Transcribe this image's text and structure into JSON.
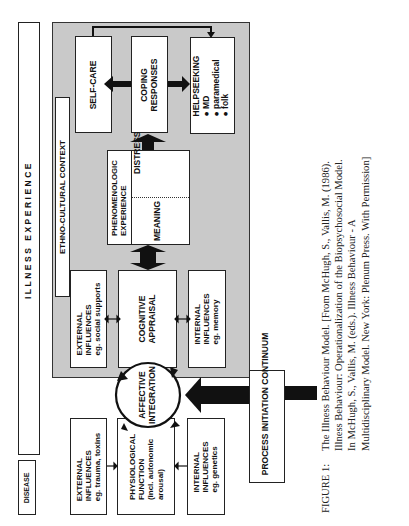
{
  "diagram": {
    "title_strip": "ILLNESS EXPERIENCE",
    "disease_label": "DISEASE",
    "context_label": "ETHNO-CULTURAL CONTEXT",
    "outcomes": {
      "self_care": "SELF-CARE",
      "coping": [
        "COPING",
        "RESPONSES"
      ],
      "helpseeking": {
        "title": "HELPSEEKING",
        "items": [
          "MD",
          "paramedical",
          "folk"
        ],
        "bullet": "●"
      }
    },
    "phenomenologic": {
      "title": [
        "PHENOMENOLOGIC",
        "EXPERIENCE"
      ],
      "meaning": "MEANING",
      "distress": "DISTRESS"
    },
    "appraisal_row": {
      "external": [
        "EXTERNAL",
        "INFLUENCES",
        "eg. social supports"
      ],
      "cognitive": [
        "COGNITIVE",
        "APPRAISAL"
      ],
      "internal": [
        "INTERNAL",
        "INFLUENCES",
        "eg. memory"
      ]
    },
    "affective": [
      "AFFECTIVE",
      "INTEGRATION"
    ],
    "physiological_row": {
      "external": [
        "EXTERNAL",
        "INFLUENCES",
        "eg. trauma, toxins"
      ],
      "physiological": [
        "PHYSIOLOGICAL",
        "FUNCTION",
        "(incl. autonomic",
        "arousal)"
      ],
      "internal": [
        "INTERNAL",
        "INFLUENCES",
        "eg. genetics"
      ]
    },
    "process_label": "PROCESS INITIATION CONTINUUM",
    "colors": {
      "shade": "#c9c9c9",
      "ink": "#111111",
      "paper": "#ffffff"
    }
  },
  "caption": {
    "label": "FIGURE 1:",
    "lines": [
      "The Illness Behaviour Model.  [From McHugh, S., Vallis, M. (1986).",
      "Illness Behaviour:  Operationalization of the Biopsychosocial Model.",
      "In McHugh, S., Vallis, M. (eds.).  Illness Behaviour - A",
      "Multidisciplinary Model. New York: Plenum Press.  With Permission]"
    ]
  }
}
